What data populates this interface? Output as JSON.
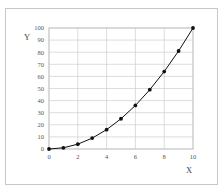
{
  "chart_data": {
    "type": "line",
    "title": "",
    "xlabel": "X",
    "ylabel": "Y",
    "xlim": [
      0,
      10
    ],
    "ylim": [
      0,
      100
    ],
    "grid": true,
    "legend": null,
    "x_ticks": [
      0,
      2,
      4,
      6,
      8,
      10
    ],
    "y_ticks": [
      0,
      10,
      20,
      30,
      40,
      50,
      60,
      70,
      80,
      90,
      100
    ],
    "series": [
      {
        "name": "y = x^2",
        "marker": "circle",
        "color": "#111111",
        "x": [
          0,
          1,
          2,
          3,
          4,
          5,
          6,
          7,
          8,
          9,
          10
        ],
        "values": [
          0,
          1,
          4,
          9,
          16,
          25,
          36,
          49,
          64,
          81,
          100
        ]
      }
    ]
  },
  "colors": {
    "grid": "#cfcfcf",
    "frame": "#c8c8c8",
    "line": "#111111"
  }
}
